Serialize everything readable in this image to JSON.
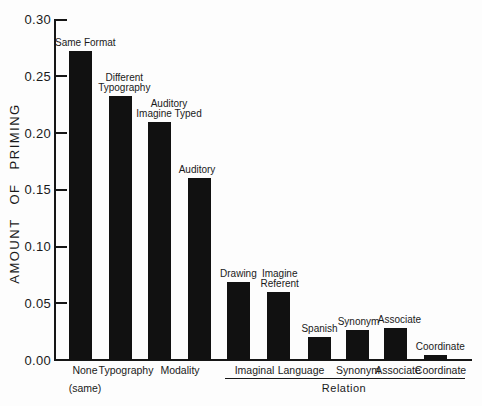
{
  "figure": {
    "background": "#fdfdfd",
    "ink_color": "#161616",
    "bar_color": "#111111"
  },
  "chart_data": {
    "type": "bar",
    "title": "",
    "ylabel": "AMOUNT OF PRIMING",
    "xlabel": "",
    "ylim": [
      0,
      0.3
    ],
    "ytick_step": 0.05,
    "yticks": [
      "0.00",
      "0.05",
      "0.10",
      "0.15",
      "0.20",
      "0.25",
      "0.30"
    ],
    "grid": false,
    "legend_position": "none",
    "bars": [
      {
        "name": "Same Format",
        "label_lines": [
          "Same Format"
        ],
        "group": "None (same)",
        "value": 0.272
      },
      {
        "name": "Different Typography",
        "label_lines": [
          "Different",
          "Typography"
        ],
        "group": "Typography",
        "value": 0.233
      },
      {
        "name": "Auditory Imagine Typed",
        "label_lines": [
          "Auditory",
          "Imagine Typed"
        ],
        "group": "Modality",
        "value": 0.21
      },
      {
        "name": "Auditory",
        "label_lines": [
          "Auditory"
        ],
        "group": "Modality",
        "value": 0.16
      },
      {
        "name": "Drawing",
        "label_lines": [
          "Drawing"
        ],
        "group": "Imaginal",
        "value": 0.069
      },
      {
        "name": "Imagine Referent",
        "label_lines": [
          "Imagine",
          "Referent"
        ],
        "group": "Imaginal",
        "value": 0.06
      },
      {
        "name": "Spanish",
        "label_lines": [
          "Spanish"
        ],
        "group": "Language",
        "value": 0.02
      },
      {
        "name": "Synonym",
        "label_lines": [
          "Synonym"
        ],
        "group": "Synonym",
        "value": 0.026
      },
      {
        "name": "Associate",
        "label_lines": [
          "Associate"
        ],
        "group": "Associate",
        "value": 0.028
      },
      {
        "name": "Coordinate",
        "label_lines": [
          "Coordinate"
        ],
        "group": "Coordinate",
        "value": 0.004
      }
    ],
    "x_groups": [
      {
        "lines": [
          "None",
          "(same)"
        ]
      },
      {
        "lines": [
          "Typography"
        ]
      },
      {
        "lines": [
          "Modality"
        ]
      },
      {
        "lines": [
          "Imaginal"
        ]
      },
      {
        "lines": [
          "Language"
        ]
      },
      {
        "lines": [
          "Synonym"
        ]
      },
      {
        "lines": [
          "Associate"
        ]
      },
      {
        "lines": [
          "Coordinate"
        ]
      }
    ],
    "group_bracket": {
      "label": "Relation",
      "covers": [
        "Imaginal",
        "Language",
        "Synonym",
        "Associate",
        "Coordinate"
      ]
    }
  }
}
